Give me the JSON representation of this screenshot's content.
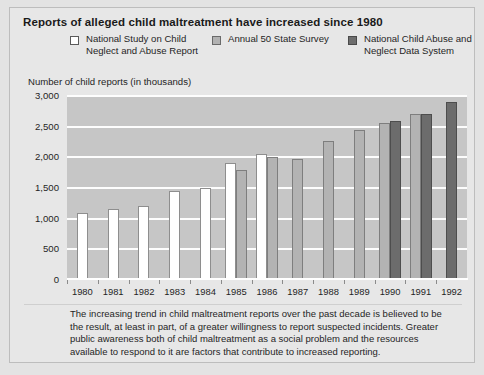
{
  "figure": {
    "title": "Reports of alleged child maltreatment have increased since 1980",
    "y_axis_caption": "Number of child reports (in thousands)",
    "caption": "The increasing trend in child maltreatment reports over the past decade is believed to be the result, at least in part, of a greater willingness to report suspected incidents. Greater public awareness both of child maltreatment as a social problem and the resources available to respond to it are factors that contribute to increased reporting."
  },
  "legend": {
    "items": [
      {
        "label": "National Study on Child Neglect and Abuse Report",
        "swatch": "white",
        "color": "#ffffff"
      },
      {
        "label": "Annual 50 State Survey",
        "swatch": "mid",
        "color": "#b3b3b3"
      },
      {
        "label": "National Child Abuse and Neglect Data System",
        "swatch": "dark",
        "color": "#6c6c6c"
      }
    ]
  },
  "chart_data": {
    "type": "bar",
    "title": "Reports of alleged child maltreatment have increased since 1980",
    "xlabel": "",
    "ylabel": "Number of child reports (in thousands)",
    "ylim": [
      0,
      3000
    ],
    "yticks": [
      0,
      500,
      1000,
      1500,
      2000,
      2500,
      3000
    ],
    "ytick_labels": [
      "0",
      "500",
      "1,000",
      "1,500",
      "2,000",
      "2,500",
      "3,000"
    ],
    "grid": true,
    "legend_position": "top",
    "categories": [
      "1980",
      "1981",
      "1982",
      "1983",
      "1984",
      "1985",
      "1986",
      "1987",
      "1988",
      "1989",
      "1990",
      "1991",
      "1992"
    ],
    "series": [
      {
        "name": "National Study on Child Neglect and Abuse Report",
        "color": "#ffffff",
        "values": [
          1100,
          1150,
          1200,
          1450,
          1500,
          1900,
          2050,
          null,
          null,
          null,
          null,
          null,
          null
        ]
      },
      {
        "name": "Annual 50 State Survey",
        "color": "#b3b3b3",
        "values": [
          null,
          null,
          null,
          null,
          null,
          1800,
          2000,
          1975,
          2260,
          2440,
          2560,
          2700,
          null
        ]
      },
      {
        "name": "National Child Abuse and Neglect Data System",
        "color": "#6c6c6c",
        "values": [
          null,
          null,
          null,
          null,
          null,
          null,
          null,
          null,
          null,
          null,
          2600,
          2700,
          2900
        ]
      }
    ]
  }
}
